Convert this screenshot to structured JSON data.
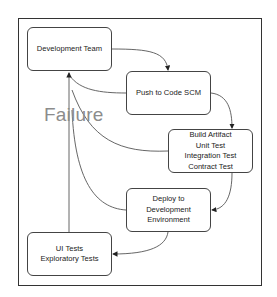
{
  "diagram": {
    "type": "flowchart",
    "nodes": [
      {
        "id": "dev_team",
        "lines": [
          "Development Team"
        ]
      },
      {
        "id": "push_scm",
        "lines": [
          "Push to Code SCM"
        ]
      },
      {
        "id": "build",
        "lines": [
          "Build Artifact",
          "Unit Test",
          "Integration Test",
          "Contract Test"
        ]
      },
      {
        "id": "deploy",
        "lines": [
          "Deploy to",
          "Development",
          "Environment"
        ]
      },
      {
        "id": "ui_tests",
        "lines": [
          "UI Tests",
          "Exploratory Tests"
        ]
      }
    ],
    "edges": [
      {
        "from": "dev_team",
        "to": "push_scm"
      },
      {
        "from": "push_scm",
        "to": "build"
      },
      {
        "from": "build",
        "to": "deploy"
      },
      {
        "from": "deploy",
        "to": "ui_tests"
      },
      {
        "from": "push_scm",
        "to": "dev_team",
        "label": "Failure"
      },
      {
        "from": "build",
        "to": "dev_team",
        "label": "Failure"
      },
      {
        "from": "deploy",
        "to": "dev_team",
        "label": "Failure"
      },
      {
        "from": "ui_tests",
        "to": "dev_team",
        "label": "Failure"
      }
    ],
    "failure_label": "Failure",
    "colors": {
      "stroke": "#444444",
      "failure_text": "#8c8c8c",
      "background": "#ffffff"
    }
  }
}
